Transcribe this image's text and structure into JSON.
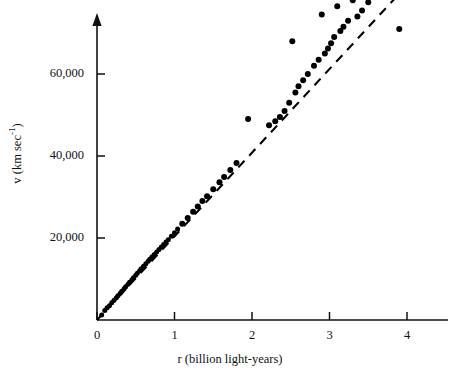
{
  "chart_data": {
    "type": "scatter",
    "title": "",
    "xlabel": "r (billion light-years)",
    "ylabel": "v (km sec",
    "ylabel_exponent": "-1",
    "ylabel_close": ")",
    "xlim": [
      0,
      4.25
    ],
    "ylim": [
      0,
      88000
    ],
    "xticks": [
      0,
      1,
      2,
      3,
      4
    ],
    "xtick_labels": [
      "0",
      "1",
      "2",
      "3",
      "4"
    ],
    "yticks": [
      20000,
      40000,
      60000,
      80000
    ],
    "ytick_labels": [
      "20,000",
      "40,000",
      "60,000",
      "80,000"
    ],
    "grid": false,
    "legend": null,
    "axis_color": "#111111",
    "point_color": "#000000",
    "line_color": "#000000",
    "trendline": {
      "style": "dashed",
      "x": [
        0.0,
        3.95
      ],
      "y": [
        0,
        80600
      ],
      "slope": 20400,
      "intercept": 0
    },
    "x": [
      0.06,
      0.1,
      0.13,
      0.16,
      0.19,
      0.22,
      0.25,
      0.27,
      0.3,
      0.32,
      0.35,
      0.37,
      0.4,
      0.42,
      0.45,
      0.47,
      0.5,
      0.52,
      0.55,
      0.57,
      0.6,
      0.63,
      0.66,
      0.68,
      0.71,
      0.74,
      0.77,
      0.8,
      0.83,
      0.86,
      0.89,
      0.92,
      0.96,
      1.0,
      1.04,
      1.1,
      1.17,
      1.24,
      1.3,
      1.36,
      1.42,
      1.5,
      1.58,
      1.64,
      1.72,
      1.8,
      1.95,
      2.22,
      2.3,
      2.36,
      2.42,
      2.48,
      2.52,
      2.56,
      2.6,
      2.66,
      2.72,
      2.8,
      2.86,
      2.9,
      2.94,
      2.98,
      3.02,
      3.06,
      3.1,
      3.14,
      3.18,
      3.24,
      3.3,
      3.36,
      3.42,
      3.5,
      3.9
    ],
    "y": [
      1200,
      2300,
      3000,
      3500,
      4200,
      4800,
      5400,
      5900,
      6500,
      7000,
      7600,
      8100,
      8700,
      9200,
      9800,
      10300,
      10900,
      11400,
      12000,
      12500,
      13100,
      13700,
      14300,
      14800,
      15400,
      16000,
      16600,
      17200,
      17800,
      18400,
      19000,
      19600,
      20400,
      21300,
      22200,
      23500,
      24900,
      26400,
      27700,
      29000,
      30200,
      31900,
      33600,
      34900,
      36600,
      38300,
      49000,
      47500,
      48500,
      49500,
      51000,
      53000,
      68000,
      55500,
      57000,
      58500,
      60000,
      62000,
      63500,
      74500,
      65000,
      66200,
      67500,
      69000,
      76500,
      70500,
      71500,
      73000,
      78000,
      74000,
      75500,
      77500,
      71000
    ],
    "n_points": 73
  },
  "figure": {
    "background": "#ffffff",
    "width": 460,
    "height": 381
  }
}
